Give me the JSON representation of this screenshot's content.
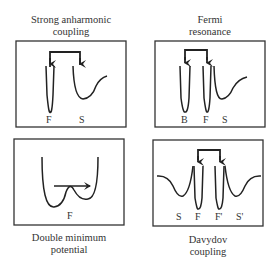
{
  "panels": [
    {
      "id": "strong-anharmonic",
      "title_line1": "Strong anharmonic",
      "title_line2": "coupling",
      "labels": [
        "F",
        "S"
      ]
    },
    {
      "id": "fermi-resonance",
      "title_line1": "Fermi",
      "title_line2": "resonance",
      "labels": [
        "B",
        "F",
        "S"
      ]
    },
    {
      "id": "double-minimum",
      "title_line1": "Double minimum",
      "title_line2": "potential",
      "labels": [
        "F"
      ]
    },
    {
      "id": "davydov",
      "title_line1": "Davydov",
      "title_line2": "coupling",
      "labels": [
        "S",
        "F",
        "F'",
        "S'"
      ]
    }
  ]
}
